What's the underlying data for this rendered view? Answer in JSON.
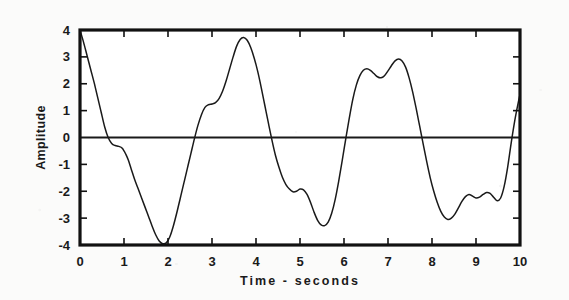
{
  "chart_data": {
    "type": "line",
    "title": "",
    "xlabel": "Time - seconds",
    "ylabel": "Amplitude",
    "xlim": [
      0,
      10
    ],
    "ylim": [
      -4,
      4
    ],
    "grid": false,
    "legend": "none",
    "zero_line": true,
    "x_ticks": [
      "0",
      "1",
      "2",
      "3",
      "4",
      "5",
      "6",
      "7",
      "8",
      "9",
      "10"
    ],
    "y_ticks": [
      "4",
      "3",
      "2",
      "1",
      "0",
      "-1",
      "-2",
      "-3",
      "-4"
    ],
    "line_color": "#1a1a1a",
    "frame_color": "#111111",
    "background_color": "#fbfbfa",
    "series": [
      {
        "name": "amplitude",
        "x": [
          0.0,
          0.08,
          0.16,
          0.24,
          0.32,
          0.4,
          0.48,
          0.56,
          0.64,
          0.72,
          0.8,
          0.88,
          0.96,
          1.04,
          1.1,
          1.16,
          1.24,
          1.32,
          1.4,
          1.48,
          1.56,
          1.64,
          1.72,
          1.8,
          1.88,
          1.96,
          2.04,
          2.12,
          2.2,
          2.28,
          2.36,
          2.44,
          2.52,
          2.6,
          2.68,
          2.76,
          2.84,
          2.92,
          3.0,
          3.08,
          3.16,
          3.24,
          3.32,
          3.4,
          3.48,
          3.56,
          3.64,
          3.72,
          3.8,
          3.88,
          3.96,
          4.04,
          4.12,
          4.2,
          4.28,
          4.36,
          4.44,
          4.52,
          4.6,
          4.68,
          4.76,
          4.84,
          4.92,
          5.0,
          5.08,
          5.16,
          5.24,
          5.32,
          5.4,
          5.48,
          5.56,
          5.64,
          5.72,
          5.8,
          5.88,
          5.96,
          6.04,
          6.12,
          6.2,
          6.28,
          6.36,
          6.44,
          6.52,
          6.6,
          6.68,
          6.76,
          6.84,
          6.92,
          7.0,
          7.08,
          7.16,
          7.24,
          7.32,
          7.4,
          7.48,
          7.56,
          7.64,
          7.72,
          7.8,
          7.88,
          7.96,
          8.04,
          8.12,
          8.2,
          8.28,
          8.36,
          8.44,
          8.52,
          8.6,
          8.68,
          8.76,
          8.84,
          8.92,
          9.0,
          9.08,
          9.16,
          9.24,
          9.32,
          9.4,
          9.48,
          9.56,
          9.64,
          9.72,
          9.8,
          9.88,
          9.96,
          10.0
        ],
        "y": [
          4.0,
          3.55,
          3.05,
          2.55,
          2.05,
          1.5,
          0.95,
          0.4,
          0.0,
          -0.22,
          -0.3,
          -0.33,
          -0.4,
          -0.62,
          -0.85,
          -1.15,
          -1.55,
          -1.9,
          -2.25,
          -2.6,
          -2.95,
          -3.3,
          -3.62,
          -3.85,
          -3.95,
          -3.92,
          -3.7,
          -3.3,
          -2.8,
          -2.25,
          -1.7,
          -1.15,
          -0.6,
          -0.05,
          0.45,
          0.85,
          1.12,
          1.22,
          1.25,
          1.3,
          1.45,
          1.72,
          2.1,
          2.55,
          3.0,
          3.4,
          3.65,
          3.72,
          3.62,
          3.35,
          2.95,
          2.45,
          1.85,
          1.2,
          0.55,
          -0.08,
          -0.65,
          -1.1,
          -1.48,
          -1.75,
          -1.92,
          -2.02,
          -2.0,
          -1.92,
          -1.95,
          -2.12,
          -2.42,
          -2.78,
          -3.08,
          -3.25,
          -3.28,
          -3.15,
          -2.82,
          -2.3,
          -1.62,
          -0.85,
          -0.05,
          0.72,
          1.42,
          1.95,
          2.3,
          2.5,
          2.56,
          2.5,
          2.38,
          2.26,
          2.22,
          2.3,
          2.48,
          2.68,
          2.85,
          2.92,
          2.85,
          2.62,
          2.22,
          1.7,
          1.08,
          0.42,
          -0.25,
          -0.9,
          -1.5,
          -2.0,
          -2.42,
          -2.75,
          -2.96,
          -3.05,
          -3.0,
          -2.85,
          -2.62,
          -2.38,
          -2.2,
          -2.12,
          -2.18,
          -2.25,
          -2.22,
          -2.12,
          -2.05,
          -2.08,
          -2.22,
          -2.35,
          -2.25,
          -1.82,
          -1.1,
          -0.2,
          0.62,
          1.3,
          1.6
        ]
      }
    ],
    "features": {
      "description": "Quasi-periodic oscillating waveform, amplitude clipped near +/-4",
      "peaks": [
        {
          "t": 0.0,
          "y": 4.0
        },
        {
          "t": 2.22,
          "y": 3.72
        },
        {
          "t": 3.95,
          "y": 2.58
        },
        {
          "t": 4.48,
          "y": 2.92
        },
        {
          "t": 6.13,
          "y": 3.55
        },
        {
          "t": 8.37,
          "y": 4.0
        },
        {
          "t": 10.0,
          "y": 0.72
        }
      ],
      "troughs": [
        {
          "t": 1.08,
          "y": -3.95
        },
        {
          "t": 3.38,
          "y": -3.3
        },
        {
          "t": 5.02,
          "y": -3.05
        },
        {
          "t": 5.62,
          "y": -2.28
        },
        {
          "t": 7.27,
          "y": -3.72
        },
        {
          "t": 9.5,
          "y": -4.0
        }
      ],
      "zero_crossings": [
        0.36,
        1.52,
        2.55,
        3.72,
        4.72,
        5.86,
        6.95,
        8.04,
        8.9,
        9.86
      ]
    }
  },
  "axes": {
    "y_label": "Amplitude",
    "x_label": "Time - seconds"
  }
}
